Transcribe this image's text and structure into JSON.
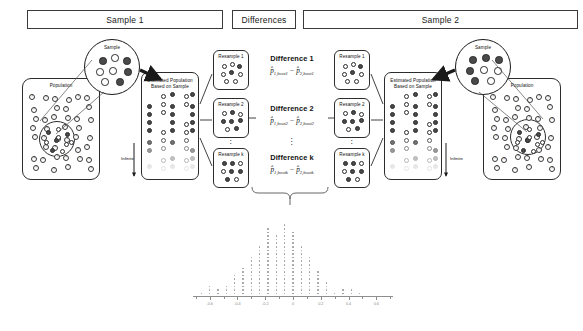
{
  "headers": {
    "sample1": "Sample 1",
    "differences": "Differences",
    "sample2": "Sample 2"
  },
  "labels": {
    "population": "Population",
    "sample": "Sample",
    "estimated_population_line1": "Estimated Population",
    "estimated_population_line2": "Based on Sample",
    "infinite": "Infinite",
    "resample1": "Resample 1",
    "resample2": "Resample 2",
    "resample_k": "Resample k",
    "vertical_dots": "⋮"
  },
  "differences": [
    {
      "title": "Difference 1",
      "formula_prefix": "p̂",
      "sub1": "1,boot1",
      "minus": "−",
      "sub2": "2,boot1"
    },
    {
      "title": "Difference 2",
      "formula_prefix": "p̂",
      "sub1": "1,boot2",
      "minus": "−",
      "sub2": "2,boot2"
    },
    {
      "title": "Difference k",
      "formula_prefix": "p̂",
      "sub1": "1,bootk",
      "minus": "−",
      "sub2": "2,bootk"
    }
  ],
  "colors": {
    "ink": "#1a1a1a",
    "dot_fill": "#4a4a4a",
    "dot_open": "#ffffff",
    "hist_dot": "#9a9a9a",
    "axis": "#8e8e8e"
  },
  "chart_data": {
    "type": "bar",
    "title": "",
    "xlabel": "",
    "ylabel": "",
    "grid": false,
    "legend": "none",
    "xlim": [
      -0.72,
      0.72
    ],
    "ylim": [
      0,
      22
    ],
    "tick_values": [
      -0.6,
      -0.4,
      -0.2,
      0,
      0.2,
      0.4,
      0.6
    ],
    "tick_labels": [
      "-0.6",
      "-0.4",
      "-0.2",
      "0",
      "0.2",
      "0.4",
      "0.6"
    ],
    "categories": [
      -0.66,
      -0.6,
      -0.54,
      -0.48,
      -0.42,
      -0.36,
      -0.3,
      -0.24,
      -0.18,
      -0.12,
      -0.06,
      0,
      0.06,
      0.12,
      0.18,
      0.24,
      0.3,
      0.36,
      0.42,
      0.48
    ],
    "values": [
      1,
      3,
      2,
      3,
      6,
      8,
      11,
      14,
      19,
      17,
      20,
      18,
      14,
      11,
      7,
      4,
      1,
      2,
      2,
      1
    ]
  }
}
